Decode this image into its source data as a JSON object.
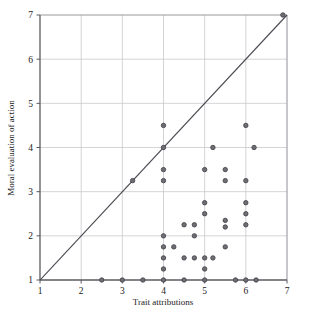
{
  "chart_data": {
    "type": "scatter",
    "title": "",
    "xlabel": "Trait attributions",
    "ylabel": "Moral evaluation of action",
    "xlim": [
      1,
      7
    ],
    "ylim": [
      1,
      7
    ],
    "xticks": [
      1,
      2,
      3,
      4,
      5,
      6,
      7
    ],
    "yticks": [
      1,
      2,
      3,
      4,
      5,
      6,
      7
    ],
    "xtick_labels": [
      "1",
      "2",
      "3",
      "4",
      "5",
      "6",
      "7"
    ],
    "ytick_labels": [
      "1",
      "2",
      "3",
      "4",
      "5",
      "6",
      "7"
    ],
    "grid": true,
    "legend": "none",
    "marker_color": "#6e6e74",
    "marker_edge_color": "#46464c",
    "marker_size": 4.4,
    "reference_line": {
      "description": "identity line y = x",
      "from": [
        1,
        1
      ],
      "to": [
        7,
        7
      ],
      "color": "#4a4a52",
      "width": 1.1
    },
    "points": [
      [
        2.5,
        1.0
      ],
      [
        3.0,
        1.0
      ],
      [
        3.25,
        3.25
      ],
      [
        3.5,
        1.0
      ],
      [
        4.0,
        4.5
      ],
      [
        4.0,
        4.0
      ],
      [
        4.0,
        3.5
      ],
      [
        4.0,
        3.25
      ],
      [
        4.0,
        2.0
      ],
      [
        4.0,
        1.75
      ],
      [
        4.0,
        1.5
      ],
      [
        4.0,
        1.25
      ],
      [
        4.0,
        1.0
      ],
      [
        4.25,
        1.75
      ],
      [
        4.5,
        2.25
      ],
      [
        4.5,
        1.5
      ],
      [
        4.5,
        1.0
      ],
      [
        4.75,
        2.25
      ],
      [
        4.75,
        2.0
      ],
      [
        4.75,
        1.5
      ],
      [
        5.0,
        3.5
      ],
      [
        5.0,
        2.75
      ],
      [
        5.0,
        2.5
      ],
      [
        5.0,
        1.5
      ],
      [
        5.0,
        1.25
      ],
      [
        5.0,
        1.0
      ],
      [
        5.2,
        4.0
      ],
      [
        5.2,
        1.5
      ],
      [
        5.5,
        3.5
      ],
      [
        5.5,
        3.25
      ],
      [
        5.5,
        2.35
      ],
      [
        5.5,
        2.2
      ],
      [
        5.5,
        1.75
      ],
      [
        5.75,
        1.0
      ],
      [
        6.0,
        4.5
      ],
      [
        6.0,
        3.25
      ],
      [
        6.0,
        2.75
      ],
      [
        6.0,
        2.5
      ],
      [
        6.0,
        2.25
      ],
      [
        6.0,
        1.0
      ],
      [
        6.2,
        4.0
      ],
      [
        6.25,
        1.0
      ],
      [
        6.9,
        7.0
      ]
    ]
  }
}
